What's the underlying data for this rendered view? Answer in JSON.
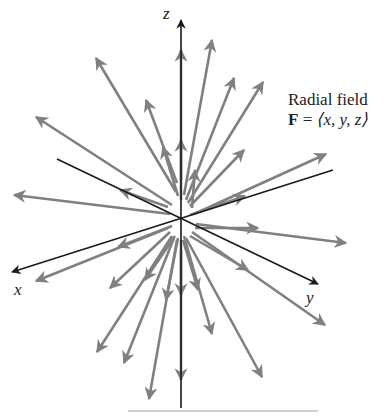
{
  "figure": {
    "title_line1": "Radial field",
    "title_vector": "F",
    "title_equals": " = ",
    "title_formula": "⟨x, y, z⟩",
    "axes": {
      "x_label": "x",
      "y_label": "y",
      "z_label": "z"
    },
    "colors": {
      "axis": "#1a1a1a",
      "arrow": "#808080",
      "background": "#ffffff"
    },
    "origin_px": [
      181,
      219
    ],
    "axis_lines": [
      {
        "name": "z",
        "from": [
          181,
          408
        ],
        "to": [
          181,
          20
        ],
        "arrow_at_end": true
      },
      {
        "name": "x",
        "from": [
          333,
          170
        ],
        "to": [
          12,
          272
        ],
        "arrow_at_end": true
      },
      {
        "name": "y",
        "from": [
          57,
          159
        ],
        "to": [
          318,
          284
        ],
        "arrow_at_end": true
      }
    ],
    "arrows": [
      {
        "from": [
          176,
          192
        ],
        "to": [
          96,
          58
        ]
      },
      {
        "from": [
          172,
          205
        ],
        "to": [
          36,
          117
        ]
      },
      {
        "from": [
          170,
          214
        ],
        "to": [
          14,
          195
        ]
      },
      {
        "from": [
          168,
          207
        ],
        "to": [
          120,
          190
        ]
      },
      {
        "from": [
          177,
          183
        ],
        "to": [
          146,
          100
        ]
      },
      {
        "from": [
          178,
          196
        ],
        "to": [
          163,
          147
        ]
      },
      {
        "from": [
          181,
          180
        ],
        "to": [
          181,
          50
        ]
      },
      {
        "from": [
          181,
          200
        ],
        "to": [
          181,
          140
        ]
      },
      {
        "from": [
          184,
          195
        ],
        "to": [
          212,
          40
        ]
      },
      {
        "from": [
          186,
          200
        ],
        "to": [
          234,
          78
        ]
      },
      {
        "from": [
          188,
          203
        ],
        "to": [
          263,
          82
        ]
      },
      {
        "from": [
          190,
          206
        ],
        "to": [
          244,
          150
        ]
      },
      {
        "from": [
          192,
          208
        ],
        "to": [
          195,
          170
        ]
      },
      {
        "from": [
          194,
          214
        ],
        "to": [
          326,
          154
        ]
      },
      {
        "from": [
          190,
          215
        ],
        "to": [
          245,
          196
        ]
      },
      {
        "from": [
          196,
          224
        ],
        "to": [
          346,
          243
        ]
      },
      {
        "from": [
          195,
          228
        ],
        "to": [
          258,
          228
        ]
      },
      {
        "from": [
          192,
          232
        ],
        "to": [
          325,
          325
        ]
      },
      {
        "from": [
          190,
          236
        ],
        "to": [
          248,
          270
        ]
      },
      {
        "from": [
          186,
          238
        ],
        "to": [
          262,
          377
        ]
      },
      {
        "from": [
          184,
          236
        ],
        "to": [
          212,
          334
        ]
      },
      {
        "from": [
          183,
          240
        ],
        "to": [
          198,
          290
        ]
      },
      {
        "from": [
          181,
          240
        ],
        "to": [
          181,
          380
        ]
      },
      {
        "from": [
          181,
          250
        ],
        "to": [
          181,
          295
        ]
      },
      {
        "from": [
          177,
          240
        ],
        "to": [
          149,
          399
        ]
      },
      {
        "from": [
          174,
          238
        ],
        "to": [
          124,
          363
        ]
      },
      {
        "from": [
          172,
          236
        ],
        "to": [
          97,
          352
        ]
      },
      {
        "from": [
          170,
          232
        ],
        "to": [
          110,
          288
        ]
      },
      {
        "from": [
          168,
          228
        ],
        "to": [
          36,
          281
        ]
      },
      {
        "from": [
          172,
          226
        ],
        "to": [
          118,
          247
        ]
      },
      {
        "from": [
          175,
          236
        ],
        "to": [
          145,
          280
        ]
      },
      {
        "from": [
          178,
          238
        ],
        "to": [
          166,
          300
        ]
      }
    ]
  }
}
